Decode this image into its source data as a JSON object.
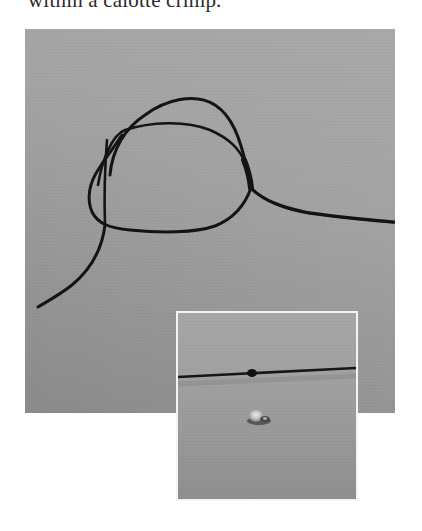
{
  "caption": {
    "text": "within a calotte crimp."
  },
  "main_photo": {
    "subject": "black cord tied in a loop knot on grey surface",
    "background_color": "#a2a2a2",
    "cord_color": "#141414"
  },
  "inset_photo": {
    "subject": "cord with small knot and a calotte crimp below",
    "border_color": "#f4f4f4",
    "background_color": "#9c9c9c",
    "cord_color": "#161616",
    "crimp_color": "#c8c8c8"
  }
}
